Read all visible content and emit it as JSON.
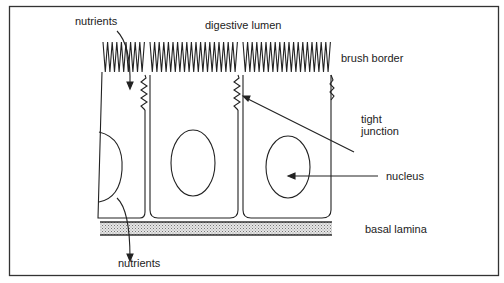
{
  "diagram": {
    "type": "anatomy-schematic",
    "labels": {
      "nutrients_top": "nutrients",
      "digestive_lumen": "digestive lumen",
      "brush_border": "brush border",
      "tight_junction_1": "tight",
      "tight_junction_2": "junction",
      "nucleus": "nucleus",
      "basal_lamina": "basal lamina",
      "nutrients_bottom": "nutrients"
    },
    "colors": {
      "line": "#222222",
      "lamina_fill": "#c8c8c8",
      "background": "#ffffff"
    }
  }
}
